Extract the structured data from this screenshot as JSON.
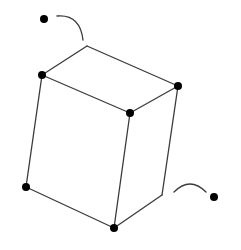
{
  "diagram": {
    "title": "",
    "colors": {
      "line": "#3a3a3a",
      "dot": "#000000",
      "background": "#ffffff"
    },
    "vertices": [
      {
        "id": "top-back",
        "x": 87,
        "y": 46,
        "dot": false
      },
      {
        "id": "top-left",
        "x": 42,
        "y": 75,
        "dot": true
      },
      {
        "id": "top-right",
        "x": 178,
        "y": 86,
        "dot": true
      },
      {
        "id": "top-front",
        "x": 130,
        "y": 113,
        "dot": true
      },
      {
        "id": "bottom-left",
        "x": 26,
        "y": 187,
        "dot": true
      },
      {
        "id": "bottom-right-inner",
        "x": 162,
        "y": 195,
        "dot": false
      },
      {
        "id": "bottom-front",
        "x": 114,
        "y": 228,
        "dot": true
      }
    ],
    "free_dots": [
      {
        "id": "upper-left-dot",
        "x": 44,
        "y": 19
      },
      {
        "id": "lower-right-dot",
        "x": 214,
        "y": 197
      }
    ],
    "arcs": [
      {
        "id": "upper-arc",
        "from": [
          57,
          16
        ],
        "to": [
          83,
          40
        ]
      },
      {
        "id": "lower-arc",
        "from": [
          174,
          191
        ],
        "to": [
          206,
          191
        ]
      }
    ]
  }
}
